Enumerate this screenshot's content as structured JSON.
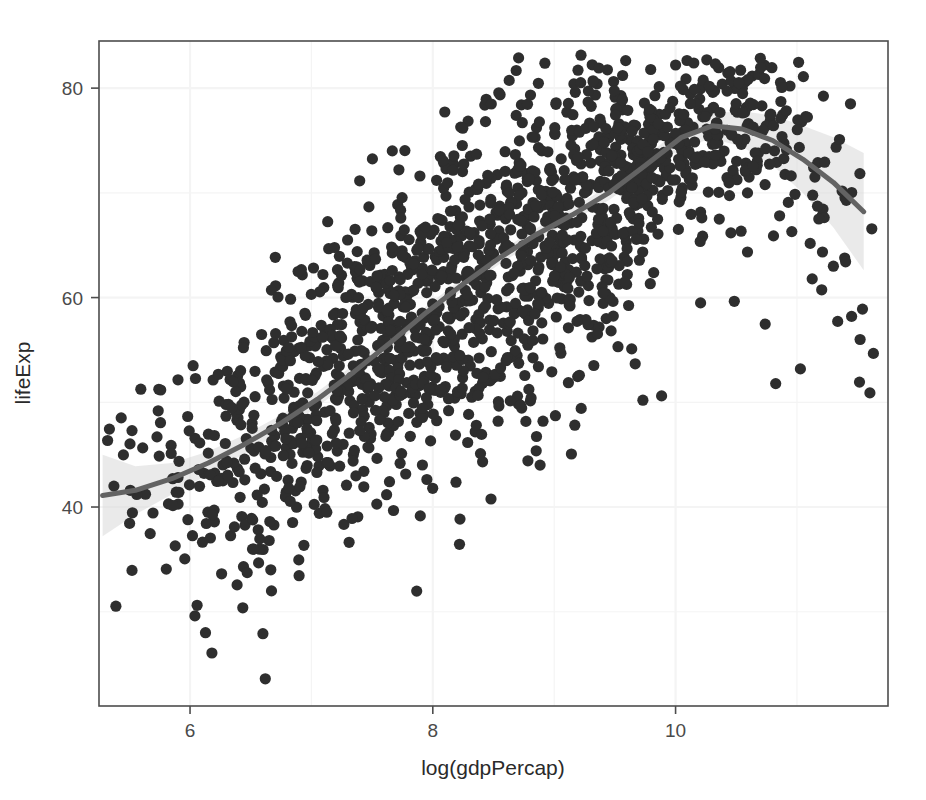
{
  "page": {
    "scan_header_left": "",
    "scan_header_right": ""
  },
  "figure": {
    "name": "loess-scatter-lifeexp-vs-loggdppercap"
  },
  "chart_data": {
    "type": "scatter",
    "title": "",
    "subtitle": "",
    "xlabel": "log(gdpPercap)",
    "ylabel": "lifeExp",
    "xlim": [
      5.25,
      11.75
    ],
    "ylim": [
      21.0,
      84.5
    ],
    "xticks": [
      6,
      8,
      10
    ],
    "xtick_labels": [
      "6",
      "8",
      "10"
    ],
    "yticks": [
      40,
      60,
      80
    ],
    "ytick_labels": [
      "40",
      "60",
      "80"
    ],
    "grid": true,
    "grid_color": "#f4f4f4",
    "panel_background": "#ffffff",
    "panel_border_color": "#4d4d4d",
    "legend": null,
    "legend_position": "none",
    "point_color": "#2e2e2e",
    "point_size": 5.6,
    "point_count": 1704,
    "smoother": {
      "name": "loess",
      "line_color": "#636363",
      "line_width": 5,
      "band_color": "#d9d9d9",
      "band_opacity": 0.55,
      "x": [
        5.28,
        5.55,
        5.85,
        6.15,
        6.45,
        6.75,
        7.05,
        7.35,
        7.65,
        7.95,
        8.25,
        8.55,
        8.85,
        9.15,
        9.45,
        9.75,
        10.05,
        10.3,
        10.55,
        10.8,
        11.05,
        11.3,
        11.55
      ],
      "y": [
        41.1,
        41.6,
        42.7,
        44.2,
        46.0,
        48.0,
        50.3,
        52.9,
        55.7,
        58.6,
        61.3,
        63.8,
        66.0,
        67.9,
        70.0,
        72.6,
        75.3,
        76.4,
        76.1,
        75.0,
        73.2,
        71.0,
        68.2
      ],
      "ymin": [
        37.2,
        39.3,
        41.2,
        43.1,
        45.1,
        47.2,
        49.6,
        52.2,
        55.1,
        58.0,
        60.7,
        63.2,
        65.4,
        67.3,
        69.3,
        71.8,
        74.3,
        75.2,
        74.4,
        72.6,
        70.0,
        66.7,
        62.6
      ],
      "ymax": [
        45.0,
        43.9,
        44.2,
        45.3,
        46.9,
        48.8,
        51.0,
        53.6,
        56.3,
        59.2,
        61.9,
        64.4,
        66.6,
        68.5,
        70.7,
        73.4,
        76.3,
        77.6,
        77.8,
        77.4,
        76.4,
        75.3,
        73.8
      ]
    },
    "series": [
      {
        "name": "countries",
        "marker": "filled-circle",
        "notes": "Gapminder country-year observations; life expectancy versus natural log of GDP per capita"
      }
    ]
  }
}
